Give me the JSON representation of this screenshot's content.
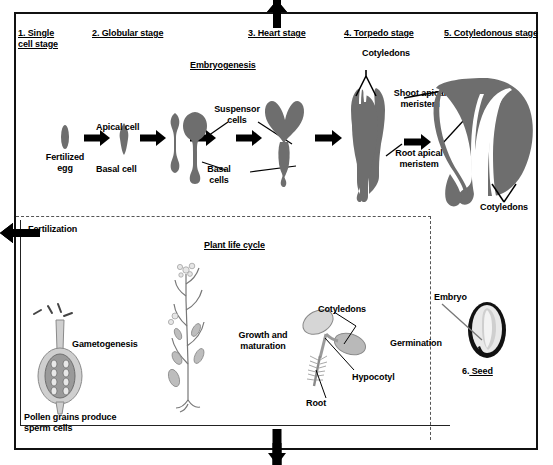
{
  "figure": {
    "embryo_color": "#6e6e6e",
    "line_color": "#000000",
    "background": "#ffffff"
  },
  "embryogenesis": {
    "section_title": "Embryogenesis",
    "stages": [
      {
        "number": "1.",
        "label": "Single\ncell stage"
      },
      {
        "number": "2.",
        "label": "Globular stage"
      },
      {
        "number": "3.",
        "label": "Heart stage"
      },
      {
        "number": "4.",
        "label": "Torpedo stage"
      },
      {
        "number": "5.",
        "label": "Cotyledonous stage"
      }
    ],
    "stage_labels": [
      "1. Single\ncell stage",
      "2. Globular stage",
      "3. Heart stage",
      "4. Torpedo stage",
      "5. Cotyledonous stage"
    ],
    "annotations": {
      "fertilized_egg": "Fertilized\negg",
      "apical_cell": "Apical cell",
      "basal_cell": "Basal cell",
      "suspensor_cells": "Suspensor\ncells",
      "basal_cells": "Basal\ncells",
      "shoot_apical_meristem": "Shoot apical\nmeristem",
      "root_apical_meristem": "Root apical\nmeristem",
      "cotyledons_torpedo": "Cotyledons",
      "cotyledons_cotyledonous": "Cotyledons"
    }
  },
  "lifecycle": {
    "section_title": "Plant life cycle",
    "steps": {
      "fertilization": "Fertilization",
      "gametogenesis": "Gametogenesis",
      "growth_and_maturation": "Growth and\nmaturation",
      "germination": "Germination"
    },
    "pollen_caption": "Pollen grains produce\nsperm cells",
    "seedling": {
      "cotyledons": "Cotyledons",
      "hypocotyl": "Hypocotyl",
      "root": "Root"
    }
  },
  "seed": {
    "embryo_label": "Embryo",
    "caption": "6. Seed",
    "number": "6."
  }
}
